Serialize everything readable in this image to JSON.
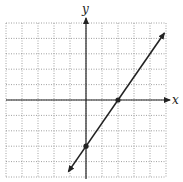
{
  "chart_data": {
    "type": "line",
    "title": "",
    "xlabel": "x",
    "ylabel": "y",
    "xlim": [
      -5,
      5
    ],
    "ylim": [
      -5,
      5
    ],
    "grid": true,
    "grid_style": "dotted",
    "series": [
      {
        "name": "line",
        "equation": "y = 1.5x - 3",
        "slope": 1.5,
        "intercept": -3,
        "x": [
          -1.1,
          4.9
        ],
        "y": [
          -4.65,
          4.35
        ],
        "arrows": "both"
      }
    ],
    "points": [
      {
        "label": "x-intercept",
        "x": 2,
        "y": 0
      },
      {
        "label": "y-intercept",
        "x": 0,
        "y": -3
      }
    ]
  },
  "labels": {
    "x_axis": "x",
    "y_axis": "y"
  },
  "colors": {
    "grid": "#888888",
    "axis": "#222222",
    "line": "#222222"
  }
}
